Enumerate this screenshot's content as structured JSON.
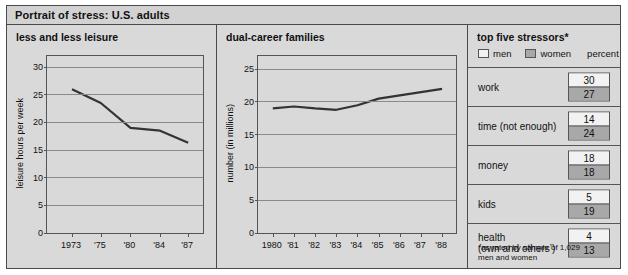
{
  "header": {
    "title": "Portrait of stress:  U.S. adults"
  },
  "chart_data": [
    {
      "type": "line",
      "title": "less and less leisure",
      "xlabel": "",
      "ylabel": "leisure hours per week",
      "categories": [
        "1973",
        "'75",
        "'80",
        "'84",
        "'87"
      ],
      "x": [
        1973,
        1975,
        1980,
        1984,
        1987
      ],
      "values": [
        26,
        23.5,
        19,
        18.5,
        16.3
      ],
      "yticks": [
        0,
        5,
        10,
        15,
        20,
        25,
        30
      ],
      "ylim": [
        0,
        32
      ],
      "xlim": [
        1971.5,
        1988.5
      ],
      "grid": true,
      "legend": "none"
    },
    {
      "type": "line",
      "title": "dual-career families",
      "xlabel": "",
      "ylabel": "number (in millions)",
      "categories": [
        "1980",
        "'81",
        "'82",
        "'83",
        "'84",
        "'85",
        "'86",
        "'87",
        "'88"
      ],
      "x": [
        1980,
        1981,
        1982,
        1983,
        1984,
        1985,
        1986,
        1987,
        1988
      ],
      "values": [
        19.0,
        19.3,
        19.0,
        18.8,
        19.5,
        20.5,
        21.0,
        21.5,
        22.0
      ],
      "yticks": [
        0,
        5,
        10,
        15,
        20,
        25
      ],
      "ylim": [
        0,
        27
      ],
      "xlim": [
        1979.4,
        1988.8
      ],
      "grid": true,
      "legend": "none"
    }
  ],
  "stressors": {
    "title": "top five stressors*",
    "legend": {
      "men": "men",
      "women": "women",
      "percent": "percent"
    },
    "rows": [
      {
        "label": "work",
        "men": "30",
        "women": "27"
      },
      {
        "label": "time (not enough)",
        "men": "14",
        "women": "24"
      },
      {
        "label": "money",
        "men": "18",
        "women": "18"
      },
      {
        "label": "kids",
        "men": "5",
        "women": "19"
      },
      {
        "label": "health",
        "label2": "(own and others’)",
        "men": "4",
        "women": "13"
      }
    ],
    "footnote_line1": "*as rated by sample of 1,029",
    "footnote_line2": "men and women"
  },
  "colors": {
    "line": "#333333",
    "grid": "#8a8a8a",
    "panel_bg": "#d9d9d9",
    "women_fill": "#a8a8a8",
    "men_fill": "#f2f2f2"
  }
}
